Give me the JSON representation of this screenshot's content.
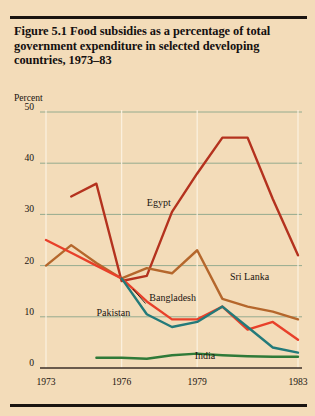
{
  "figure": {
    "title": "Figure 5.1  Food subsidies as a percentage of total government expenditure in selected developing countries, 1973–83",
    "axis_unit_label": "Percent",
    "background_color": "#f3dcb9",
    "rule_color": "#1a1410",
    "gridline_color": "#8aa58a"
  },
  "chart_data": {
    "type": "line",
    "title": "Figure 5.1  Food subsidies as a percentage of total government expenditure in selected developing countries, 1973–83",
    "xlabel": "",
    "ylabel": "Percent",
    "ylim": [
      0,
      50
    ],
    "xlim": [
      1973,
      1983
    ],
    "yticks": [
      0,
      10,
      20,
      30,
      40,
      50
    ],
    "ytick_labels": [
      "0",
      "10",
      "20",
      "30",
      "40",
      "50"
    ],
    "xticks": [
      1973,
      1976,
      1979,
      1983
    ],
    "xtick_labels": [
      "1973",
      "1976",
      "1979",
      "1983"
    ],
    "grid": true,
    "legend": "inline-annotations",
    "x": [
      1973,
      1974,
      1975,
      1976,
      1977,
      1978,
      1979,
      1980,
      1981,
      1982,
      1983
    ],
    "series": [
      {
        "name": "Egypt",
        "color": "#b4321e",
        "values": [
          null,
          33.5,
          36.0,
          17.0,
          18.0,
          30.5,
          38.0,
          45.0,
          45.0,
          33.0,
          22.0
        ],
        "label_x": 1977.0,
        "label_y": 32.0
      },
      {
        "name": "Sri Lanka",
        "color": "#b5672c",
        "values": [
          20.0,
          24.0,
          20.5,
          17.5,
          19.5,
          18.5,
          23.0,
          13.5,
          12.0,
          11.0,
          9.5
        ],
        "label_x": 1980.3,
        "label_y": 17.5
      },
      {
        "name": "Pakistan",
        "color": "#e8402a",
        "values": [
          25.0,
          22.5,
          20.0,
          17.5,
          13.0,
          9.5,
          9.5,
          12.0,
          7.5,
          9.0,
          5.5
        ],
        "label_x": 1975.0,
        "label_y": 10.5
      },
      {
        "name": "Bangladesh",
        "color": "#237a7a",
        "values": [
          null,
          null,
          null,
          17.5,
          10.5,
          8.0,
          9.0,
          12.0,
          8.0,
          4.0,
          3.0
        ],
        "label_x": 1977.1,
        "label_y": 13.5
      },
      {
        "name": "India",
        "color": "#2f7a38",
        "values": [
          null,
          null,
          2.0,
          2.0,
          1.8,
          2.5,
          2.8,
          2.5,
          2.3,
          2.2,
          2.2
        ],
        "label_x": 1978.9,
        "label_y": 2.2
      }
    ]
  }
}
